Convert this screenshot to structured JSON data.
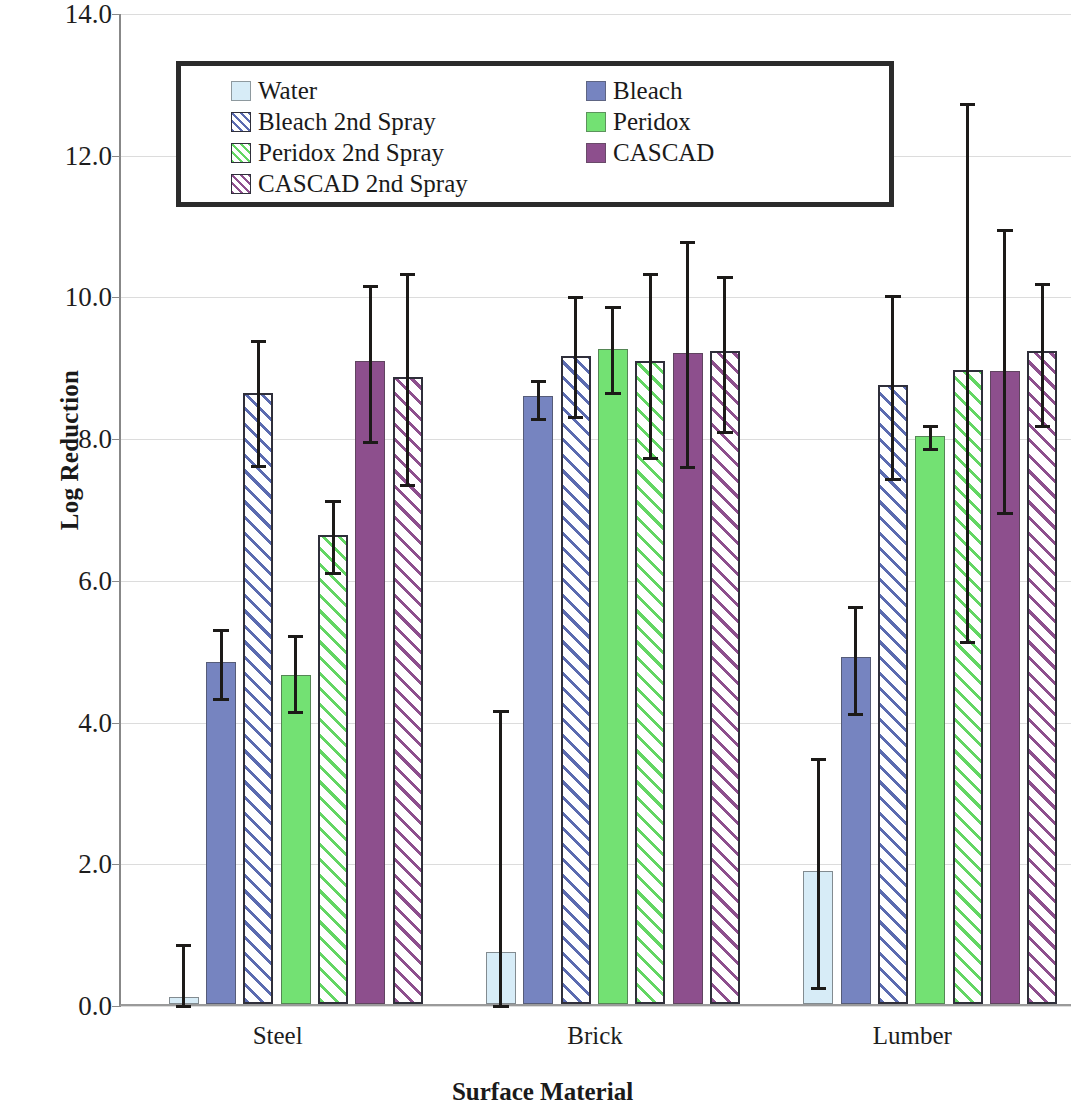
{
  "chart_data": {
    "type": "bar",
    "title": "",
    "xlabel": "Surface Material",
    "ylabel": "Log Reduction",
    "categories": [
      "Steel",
      "Brick",
      "Lumber"
    ],
    "ylim": [
      0.0,
      14.0
    ],
    "ytick_labels": [
      "0.0",
      "2.0",
      "4.0",
      "6.0",
      "8.0",
      "10.0",
      "12.0",
      "14.0"
    ],
    "ytick_values": [
      0,
      2,
      4,
      6,
      8,
      10,
      12,
      14
    ],
    "grid": true,
    "legend_position": "upper-left-inside",
    "error_bars": "asymmetric range",
    "series": [
      {
        "name": "Water",
        "color": "#d7ecf7",
        "fill": "solid",
        "values": [
          0.1,
          0.73,
          1.88
        ],
        "err_low": [
          0.0,
          0.0,
          0.25
        ],
        "err_high": [
          0.85,
          4.15,
          3.48
        ]
      },
      {
        "name": "Bleach",
        "color": "#7684c0",
        "fill": "solid",
        "values": [
          4.82,
          8.58,
          4.9
        ],
        "err_low": [
          4.32,
          8.28,
          4.12
        ],
        "err_high": [
          5.3,
          8.82,
          5.62
        ]
      },
      {
        "name": "Bleach 2nd Spray",
        "color": "#5b6bb0",
        "fill": "hatch",
        "values": [
          8.63,
          9.14,
          8.74
        ],
        "err_low": [
          7.62,
          8.3,
          7.43
        ],
        "err_high": [
          9.38,
          10.0,
          10.02
        ]
      },
      {
        "name": "Peridox",
        "color": "#73e173",
        "fill": "solid",
        "values": [
          4.65,
          9.25,
          8.02
        ],
        "err_low": [
          4.14,
          8.65,
          7.85
        ],
        "err_high": [
          5.22,
          9.86,
          8.18
        ]
      },
      {
        "name": "Peridox 2nd Spray",
        "color": "#63d663",
        "fill": "hatch",
        "values": [
          6.62,
          9.07,
          8.95
        ],
        "err_low": [
          6.1,
          7.72,
          5.13
        ],
        "err_high": [
          7.12,
          10.32,
          12.72
        ]
      },
      {
        "name": "CASCAD",
        "color": "#8d4f8d",
        "fill": "solid",
        "values": [
          9.07,
          9.19,
          8.93
        ],
        "err_low": [
          7.95,
          7.6,
          6.95
        ],
        "err_high": [
          10.15,
          10.78,
          10.95
        ]
      },
      {
        "name": "CASCAD 2nd Spray",
        "color": "#8d4f8d",
        "fill": "hatch",
        "values": [
          8.85,
          9.21,
          9.21
        ],
        "err_low": [
          7.35,
          8.1,
          8.18
        ],
        "err_high": [
          10.33,
          10.28,
          10.18
        ]
      }
    ]
  },
  "legend": {
    "items": [
      {
        "label": "Water",
        "series_index": 0,
        "column": 0
      },
      {
        "label": "Bleach",
        "series_index": 1,
        "column": 1
      },
      {
        "label": "Bleach 2nd Spray",
        "series_index": 2,
        "column": 0
      },
      {
        "label": "Peridox",
        "series_index": 3,
        "column": 1
      },
      {
        "label": "Peridox 2nd Spray",
        "series_index": 4,
        "column": 0
      },
      {
        "label": "CASCAD",
        "series_index": 5,
        "column": 1
      },
      {
        "label": "CASCAD 2nd Spray",
        "series_index": 6,
        "column": 0
      }
    ]
  }
}
